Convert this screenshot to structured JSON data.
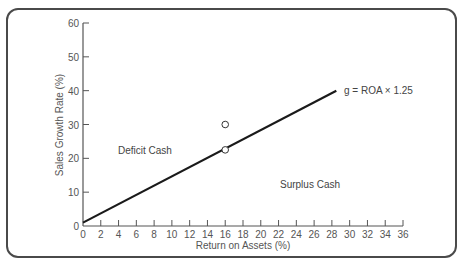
{
  "chart_data": {
    "type": "line",
    "title": "",
    "xlabel": "Return on Assets (%)",
    "ylabel": "Sales Growth Rate (%)",
    "xlim": [
      0,
      36
    ],
    "ylim": [
      0,
      60
    ],
    "x_ticks": [
      0,
      2,
      4,
      6,
      8,
      10,
      12,
      14,
      16,
      18,
      20,
      22,
      24,
      26,
      28,
      30,
      32,
      34,
      36
    ],
    "y_ticks": [
      0,
      10,
      20,
      30,
      40,
      50,
      60
    ],
    "grid": false,
    "series": [
      {
        "name": "g = ROA × 1.25",
        "x": [
          0,
          28.5
        ],
        "y": [
          1,
          40
        ]
      }
    ],
    "points": [
      {
        "x": 16,
        "y": 30,
        "marker": "open-circle"
      },
      {
        "x": 16,
        "y": 22.5,
        "marker": "open-circle"
      }
    ],
    "annotations": [
      {
        "text": "g = ROA × 1.25",
        "x": 29,
        "y": 40
      },
      {
        "text": "Deficit Cash",
        "x": 4.5,
        "y": 22
      },
      {
        "text": "Surplus Cash",
        "x": 20,
        "y": 12
      }
    ]
  },
  "labels": {
    "xlabel": "Return on Assets (%)",
    "ylabel": "Sales Growth Rate (%)",
    "line_label": "g = ROA × 1.25",
    "deficit": "Deficit Cash",
    "surplus": "Surplus Cash"
  },
  "colors": {
    "line": "#1a1a1a",
    "axis": "#555555",
    "frame": "#4a4a4a",
    "text": "#555555"
  }
}
